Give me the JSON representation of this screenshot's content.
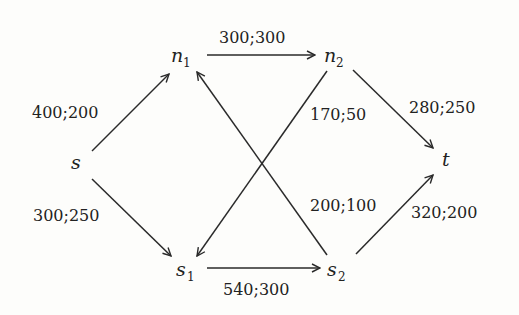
{
  "nodes": {
    "s": {
      "name": "s",
      "sub": ""
    },
    "n1": {
      "name": "n",
      "sub": "1"
    },
    "n2": {
      "name": "n",
      "sub": "2"
    },
    "t": {
      "name": "t",
      "sub": ""
    },
    "s1": {
      "name": "s",
      "sub": "1"
    },
    "s2": {
      "name": "s",
      "sub": "2"
    }
  },
  "edges": {
    "s_n1": {
      "from": "s",
      "to": "n1",
      "label": "400;200"
    },
    "s_s1": {
      "from": "s",
      "to": "s1",
      "label": "300;250"
    },
    "n1_n2": {
      "from": "n1",
      "to": "n2",
      "label": "300;300"
    },
    "n2_t": {
      "from": "n2",
      "to": "t",
      "label": "280;250"
    },
    "n2_s1": {
      "from": "n2",
      "to": "s1",
      "label": "170;50"
    },
    "s2_n1": {
      "from": "s2",
      "to": "n1",
      "label": "200;100"
    },
    "s1_s2": {
      "from": "s1",
      "to": "s2",
      "label": "540;300"
    },
    "s2_t": {
      "from": "s2",
      "to": "t",
      "label": "320;200"
    }
  }
}
